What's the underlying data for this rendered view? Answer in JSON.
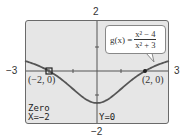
{
  "chart_data": {
    "type": "line",
    "title": "",
    "function_label": "g(x) =",
    "function_expr": {
      "numerator": "x² − 4",
      "denominator": "x² + 3"
    },
    "xlim": [
      -3,
      3
    ],
    "ylim": [
      -2,
      2
    ],
    "tick_labels": {
      "xmin": "−3",
      "xmax": "3",
      "ymin": "−2",
      "ymax": "2"
    },
    "x": [
      -3,
      -2.5,
      -2,
      -1.5,
      -1,
      -0.5,
      0,
      0.5,
      1,
      1.5,
      2,
      2.5,
      3
    ],
    "y": [
      0.417,
      0.243,
      0,
      -0.333,
      -0.75,
      -1.154,
      -1.333,
      -1.154,
      -0.75,
      -0.333,
      0,
      0.243,
      0.417
    ],
    "annotations": [
      {
        "text": "(−2, 0)",
        "x": -2,
        "y": 0
      },
      {
        "text": "(2, 0)",
        "x": 2,
        "y": 0
      }
    ],
    "grid": false,
    "ticks_step": 1
  },
  "calculator": {
    "mode_label": "Zero",
    "x_readout": "X=−2",
    "y_readout": "Y=0"
  },
  "colors": {
    "screen_bg": "#e6e6e6",
    "curve": "#555555",
    "axis": "#555555",
    "frame": "#6a6a6a"
  }
}
